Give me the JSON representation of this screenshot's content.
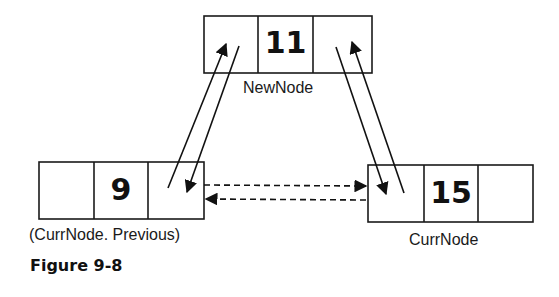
{
  "figure": {
    "caption": "Figure 9-8"
  },
  "nodes": {
    "new_node": {
      "value": "11",
      "label": "NewNode"
    },
    "prev_node": {
      "value": "9",
      "label": "(CurrNode. Previous)"
    },
    "curr_node": {
      "value": "15",
      "label": "CurrNode"
    }
  },
  "colors": {
    "stroke": "#1a1a1a",
    "background": "#ffffff"
  }
}
